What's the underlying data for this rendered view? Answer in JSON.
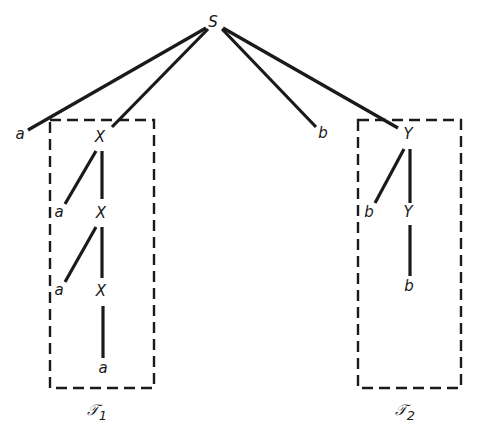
{
  "diagram": {
    "type": "parse-tree",
    "root": {
      "id": "S",
      "label": "S",
      "x": 213,
      "y": 22
    },
    "nodes": [
      {
        "id": "S",
        "label": "S",
        "x": 213,
        "y": 22
      },
      {
        "id": "a0",
        "label": "a",
        "x": 20,
        "y": 134
      },
      {
        "id": "X1",
        "label": "X",
        "x": 100,
        "y": 137
      },
      {
        "id": "b0",
        "label": "b",
        "x": 323,
        "y": 133
      },
      {
        "id": "Y1",
        "label": "Y",
        "x": 408,
        "y": 134
      },
      {
        "id": "a1",
        "label": "a",
        "x": 59,
        "y": 212
      },
      {
        "id": "X2",
        "label": "X",
        "x": 101,
        "y": 213
      },
      {
        "id": "a2",
        "label": "a",
        "x": 59,
        "y": 290
      },
      {
        "id": "X3",
        "label": "X",
        "x": 101,
        "y": 291
      },
      {
        "id": "a3",
        "label": "a",
        "x": 103,
        "y": 368
      },
      {
        "id": "b1",
        "label": "b",
        "x": 369,
        "y": 212
      },
      {
        "id": "Y2",
        "label": "Y",
        "x": 408,
        "y": 212
      },
      {
        "id": "b2",
        "label": "b",
        "x": 409,
        "y": 286
      }
    ],
    "edges": [
      {
        "from": "S",
        "to": "a0",
        "x1": 206,
        "y1": 28,
        "x2": 28,
        "y2": 130
      },
      {
        "from": "S",
        "to": "X1",
        "x1": 208,
        "y1": 29,
        "x2": 112,
        "y2": 127
      },
      {
        "from": "S",
        "to": "b0",
        "x1": 222,
        "y1": 29,
        "x2": 316,
        "y2": 127
      },
      {
        "from": "S",
        "to": "Y1",
        "x1": 223,
        "y1": 28,
        "x2": 398,
        "y2": 128
      },
      {
        "from": "X1",
        "to": "a1",
        "x1": 96,
        "y1": 151,
        "x2": 65,
        "y2": 204
      },
      {
        "from": "X1",
        "to": "X2",
        "x1": 102,
        "y1": 151,
        "x2": 102,
        "y2": 199
      },
      {
        "from": "X2",
        "to": "a2",
        "x1": 96,
        "y1": 227,
        "x2": 65,
        "y2": 282
      },
      {
        "from": "X2",
        "to": "X3",
        "x1": 102,
        "y1": 227,
        "x2": 102,
        "y2": 278
      },
      {
        "from": "X3",
        "to": "a3",
        "x1": 103,
        "y1": 306,
        "x2": 103,
        "y2": 358
      },
      {
        "from": "Y1",
        "to": "b1",
        "x1": 404,
        "y1": 149,
        "x2": 375,
        "y2": 203
      },
      {
        "from": "Y1",
        "to": "Y2",
        "x1": 410,
        "y1": 149,
        "x2": 410,
        "y2": 203
      },
      {
        "from": "Y2",
        "to": "b2",
        "x1": 410,
        "y1": 225,
        "x2": 410,
        "y2": 276
      }
    ],
    "subtrees": [
      {
        "id": "T1",
        "label": "𝒯",
        "subscript": "1",
        "box": {
          "x": 50,
          "y": 120,
          "width": 104,
          "height": 268
        },
        "label_x": 100,
        "label_y": 410
      },
      {
        "id": "T2",
        "label": "𝒯",
        "subscript": "2",
        "box": {
          "x": 358,
          "y": 120,
          "width": 103,
          "height": 268
        },
        "label_x": 408,
        "label_y": 410
      }
    ]
  }
}
